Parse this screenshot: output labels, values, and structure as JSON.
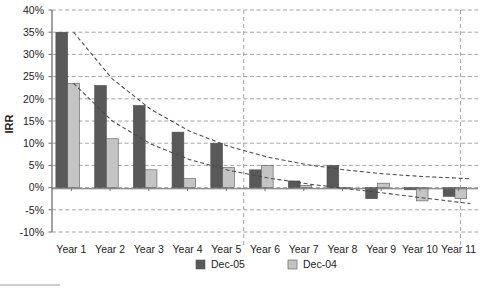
{
  "chart_data": {
    "type": "bar",
    "title": "",
    "xlabel": "",
    "ylabel": "IRR",
    "ylim": [
      -10,
      40
    ],
    "ytick_step": 5,
    "ytick_labels": [
      "40%",
      "35%",
      "30%",
      "25%",
      "20%",
      "15%",
      "10%",
      "5%",
      "0%",
      "-5%",
      "-10%"
    ],
    "ytick_values": [
      40,
      35,
      30,
      25,
      20,
      15,
      10,
      5,
      0,
      -5,
      -10
    ],
    "grid": true,
    "grid_style": "dashed-horizontal",
    "legend_position": "bottom",
    "categories": [
      "Year 1",
      "Year 2",
      "Year 3",
      "Year 4",
      "Year 5",
      "Year 6",
      "Year 7",
      "Year 8",
      "Year 9",
      "Year 10",
      "Year 11"
    ],
    "series": [
      {
        "name": "Dec-05",
        "color": "#595959",
        "values": [
          35.0,
          23.0,
          18.5,
          12.5,
          10.0,
          4.0,
          1.5,
          5.0,
          -2.5,
          -0.5,
          -2.0
        ]
      },
      {
        "name": "Dec-04",
        "color": "#c4c4c4",
        "values": [
          23.5,
          11.0,
          4.0,
          2.0,
          4.5,
          5.0,
          0.5,
          0.0,
          1.0,
          -3.0,
          -2.5
        ]
      }
    ],
    "trendlines": [
      {
        "name": "Dec-05 trend",
        "style": "dashed",
        "color": "#4a4a4a",
        "points": [
          [
            0.15,
            35.0
          ],
          [
            1.15,
            24.5
          ],
          [
            2.15,
            17.6
          ],
          [
            3.15,
            12.7
          ],
          [
            4.15,
            9.3
          ],
          [
            5.15,
            6.9
          ],
          [
            6.15,
            5.2
          ],
          [
            7.15,
            4.0
          ],
          [
            8.15,
            3.1
          ],
          [
            9.15,
            2.5
          ],
          [
            10.4,
            2.0
          ]
        ]
      },
      {
        "name": "Dec-04 trend",
        "style": "dashed",
        "color": "#4a4a4a",
        "points": [
          [
            0.15,
            23.5
          ],
          [
            1.15,
            15.0
          ],
          [
            2.15,
            9.8
          ],
          [
            3.15,
            6.3
          ],
          [
            4.15,
            3.9
          ],
          [
            5.15,
            2.2
          ],
          [
            6.15,
            0.9
          ],
          [
            7.15,
            -0.2
          ],
          [
            8.15,
            -1.2
          ],
          [
            9.15,
            -2.3
          ],
          [
            10.4,
            -3.6
          ]
        ]
      }
    ],
    "vertical_markers": [
      4.95,
      10.55
    ]
  },
  "legend": {
    "items": [
      {
        "label": "Dec-05",
        "color": "#595959"
      },
      {
        "label": "Dec-04",
        "color": "#c4c4c4"
      }
    ]
  }
}
